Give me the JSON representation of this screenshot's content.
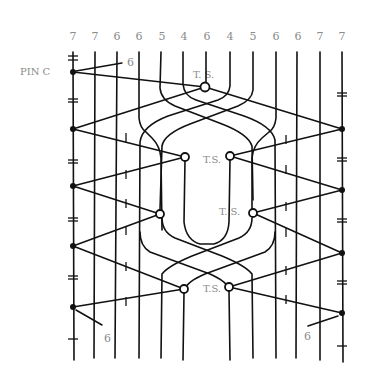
{
  "diagram": {
    "pair_counts": [
      "7",
      "7",
      "6",
      "6",
      "5",
      "4",
      "6",
      "4",
      "5",
      "6",
      "6",
      "7",
      "7"
    ],
    "column_x": [
      73,
      94,
      117,
      139,
      161,
      183,
      206,
      230,
      253,
      276,
      297,
      320,
      342
    ],
    "pin_label": "PIN C",
    "side_label_top": "6",
    "side_label_bottom_left": "6",
    "side_label_bottom_right": "6",
    "ts_labels": {
      "top": "T.  S.",
      "upper": "T.S.",
      "middle": "T.  S.",
      "lower": "T.S."
    },
    "ts_points": [
      {
        "name": "top",
        "x": 205,
        "y": 87
      },
      {
        "name": "upper-left",
        "x": 185,
        "y": 157
      },
      {
        "name": "upper-right",
        "x": 230,
        "y": 156
      },
      {
        "name": "middle-left",
        "x": 160,
        "y": 214
      },
      {
        "name": "middle-right",
        "x": 253,
        "y": 213
      },
      {
        "name": "lower-left",
        "x": 184,
        "y": 289
      },
      {
        "name": "lower-right",
        "x": 229,
        "y": 287
      }
    ],
    "left_pins_y": [
      72,
      129,
      186,
      246,
      307
    ],
    "right_pins_y": [
      129,
      190,
      253,
      313
    ],
    "colors": {
      "ink": "#111111",
      "label": "#8a8a8a",
      "background": "#ffffff"
    }
  }
}
